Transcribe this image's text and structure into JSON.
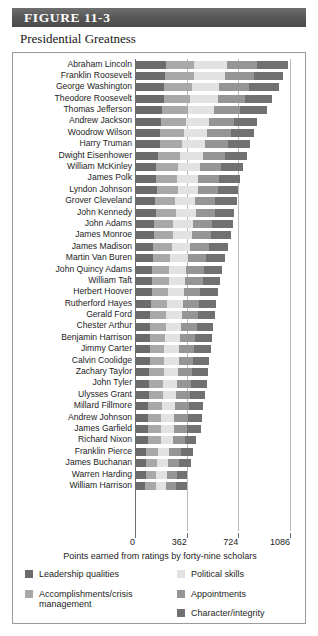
{
  "figure": {
    "header_label": "FIGURE  11-3",
    "subtitle": "Presidential Greatness",
    "header_bg": "#565656"
  },
  "chart_data": {
    "type": "bar",
    "orientation": "horizontal",
    "stacked": true,
    "title": "Presidential Greatness",
    "xlabel": "Points earned from ratings by forty-nine scholars",
    "ylabel": "",
    "xlim": [
      0,
      1086
    ],
    "ticks": [
      0,
      362,
      724,
      1086
    ],
    "tick_labels": [
      "0",
      "362",
      "724",
      "1086"
    ],
    "grid": true,
    "legend_position": "bottom",
    "series": [
      {
        "name": "Leadership qualities",
        "color": "#6b6b6b"
      },
      {
        "name": "Accomplishments/crisis management",
        "color": "#a8a8a8"
      },
      {
        "name": "Political skills",
        "color": "#e2e2e2"
      },
      {
        "name": "Appointments",
        "color": "#959595"
      },
      {
        "name": "Character/integrity",
        "color": "#717171"
      }
    ],
    "categories": [
      "Abraham Lincoln",
      "Franklin Roosevelt",
      "George Washington",
      "Theodore Roosevelt",
      "Thomas Jefferson",
      "Andrew Jackson",
      "Woodrow Wilson",
      "Harry Truman",
      "Dwight Eisenhower",
      "William McKinley",
      "James Polk",
      "Lyndon Johnson",
      "Grover Cleveland",
      "John Kennedy",
      "John Adams",
      "James Monroe",
      "James Madison",
      "Martin Van Buren",
      "John Quincy Adams",
      "William Taft",
      "Herbert Hoover",
      "Rutherford Hayes",
      "Gerald Ford",
      "Chester Arthur",
      "Benjamin Harrison",
      "Jimmy Carter",
      "Calvin Coolidge",
      "Zachary Taylor",
      "John Tyler",
      "Ulysses Grant",
      "Millard Fillmore",
      "Andrew Johnson",
      "James Garfield",
      "Richard Nixon",
      "Franklin Pierce",
      "James Buchanan",
      "Warren Harding",
      "William Harrison"
    ],
    "stacks": [
      {
        "category": "Abraham Lincoln",
        "values": [
          214,
          200,
          228,
          214,
          216
        ],
        "total": 1072
      },
      {
        "category": "Franklin Roosevelt",
        "values": [
          212,
          198,
          222,
          200,
          204
        ],
        "total": 1036
      },
      {
        "category": "George Washington",
        "values": [
          206,
          190,
          196,
          206,
          212
        ],
        "total": 1010
      },
      {
        "category": "Theodore Roosevelt",
        "values": [
          200,
          186,
          198,
          190,
          188
        ],
        "total": 962
      },
      {
        "category": "Thomas Jefferson",
        "values": [
          190,
          180,
          182,
          186,
          188
        ],
        "total": 926
      },
      {
        "category": "Andrew Jackson",
        "values": [
          182,
          172,
          166,
          172,
          162
        ],
        "total": 854
      },
      {
        "category": "Woodrow Wilson",
        "values": [
          178,
          166,
          162,
          166,
          160
        ],
        "total": 832
      },
      {
        "category": "Harry Truman",
        "values": [
          172,
          160,
          160,
          160,
          156
        ],
        "total": 808
      },
      {
        "category": "Dwight Eisenhower",
        "values": [
          160,
          156,
          158,
          154,
          154
        ],
        "total": 782
      },
      {
        "category": "William McKinley",
        "values": [
          150,
          150,
          154,
          150,
          152
        ],
        "total": 756
      },
      {
        "category": "James Polk",
        "values": [
          148,
          146,
          148,
          146,
          150
        ],
        "total": 738
      },
      {
        "category": "Lyndon Johnson",
        "values": [
          152,
          148,
          140,
          142,
          138
        ],
        "total": 720
      },
      {
        "category": "Grover Cleveland",
        "values": [
          142,
          140,
          140,
          142,
          148
        ],
        "total": 712
      },
      {
        "category": "John Kennedy",
        "values": [
          146,
          142,
          138,
          136,
          130
        ],
        "total": 692
      },
      {
        "category": "John Adams",
        "values": [
          132,
          134,
          138,
          138,
          142
        ],
        "total": 684
      },
      {
        "category": "James Monroe",
        "values": [
          132,
          132,
          134,
          134,
          138
        ],
        "total": 670
      },
      {
        "category": "James Madison",
        "values": [
          128,
          128,
          132,
          130,
          134
        ],
        "total": 652
      },
      {
        "category": "Martin Van Buren",
        "values": [
          124,
          124,
          126,
          126,
          128
        ],
        "total": 628
      },
      {
        "category": "John Quincy Adams",
        "values": [
          120,
          120,
          120,
          124,
          128
        ],
        "total": 612
      },
      {
        "category": "William Taft",
        "values": [
          118,
          118,
          118,
          120,
          122
        ],
        "total": 596
      },
      {
        "category": "Herbert Hoover",
        "values": [
          116,
          114,
          112,
          116,
          122
        ],
        "total": 580
      },
      {
        "category": "Rutherford Hayes",
        "values": [
          112,
          112,
          112,
          114,
          118
        ],
        "total": 568
      },
      {
        "category": "Gerald Ford",
        "values": [
          108,
          110,
          110,
          112,
          118
        ],
        "total": 558
      },
      {
        "category": "Chester Arthur",
        "values": [
          106,
          108,
          108,
          110,
          114
        ],
        "total": 546
      },
      {
        "category": "Benjamin Harrison",
        "values": [
          104,
          106,
          106,
          108,
          114
        ],
        "total": 538
      },
      {
        "category": "Jimmy Carter",
        "values": [
          102,
          104,
          104,
          106,
          114
        ],
        "total": 530
      },
      {
        "category": "Calvin Coolidge",
        "values": [
          102,
          102,
          102,
          104,
          110
        ],
        "total": 520
      },
      {
        "category": "Zachary Taylor",
        "values": [
          100,
          100,
          100,
          102,
          110
        ],
        "total": 512
      },
      {
        "category": "John Tyler",
        "values": [
          98,
          98,
          98,
          100,
          108
        ],
        "total": 502
      },
      {
        "category": "Ulysses Grant",
        "values": [
          98,
          96,
          96,
          98,
          102
        ],
        "total": 490
      },
      {
        "category": "Millard Fillmore",
        "values": [
          94,
          94,
          94,
          96,
          102
        ],
        "total": 480
      },
      {
        "category": "Andrew Johnson",
        "values": [
          92,
          92,
          92,
          94,
          100
        ],
        "total": 470
      },
      {
        "category": "James Garfield",
        "values": [
          90,
          90,
          90,
          92,
          98
        ],
        "total": 460
      },
      {
        "category": "Richard Nixon",
        "values": [
          92,
          88,
          86,
          88,
          72
        ],
        "total": 426
      },
      {
        "category": "Franklin Pierce",
        "values": [
          80,
          80,
          80,
          82,
          88
        ],
        "total": 410
      },
      {
        "category": "James Buchanan",
        "values": [
          76,
          76,
          76,
          78,
          84
        ],
        "total": 390
      },
      {
        "category": "Warren Harding",
        "values": [
          74,
          74,
          74,
          74,
          70
        ],
        "total": 366
      },
      {
        "category": "William Harrison",
        "values": [
          72,
          72,
          72,
          74,
          72
        ],
        "total": 362
      }
    ]
  },
  "legend": {
    "left_column": [
      {
        "label": "Leadership qualities",
        "color": "#6b6b6b"
      },
      {
        "label": "Accomplishments/crisis management",
        "color": "#a8a8a8"
      }
    ],
    "right_column": [
      {
        "label": "Political skills",
        "color": "#e2e2e2"
      },
      {
        "label": "Appointments",
        "color": "#959595"
      },
      {
        "label": "Character/integrity",
        "color": "#717171"
      }
    ]
  }
}
